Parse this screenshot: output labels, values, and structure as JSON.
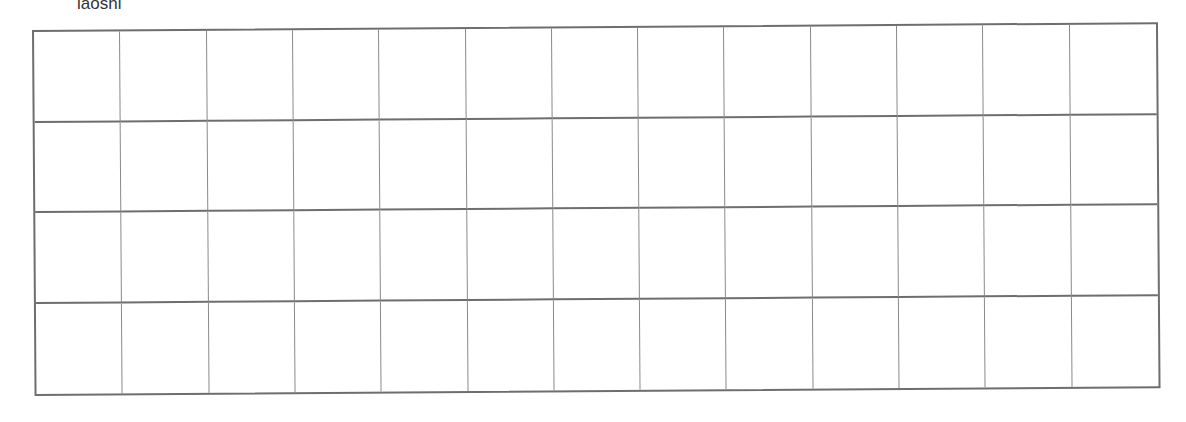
{
  "worksheet": {
    "label": "laoshi",
    "grid": {
      "rows": 4,
      "columns": 13,
      "line_color": "#6e6e6e"
    }
  }
}
